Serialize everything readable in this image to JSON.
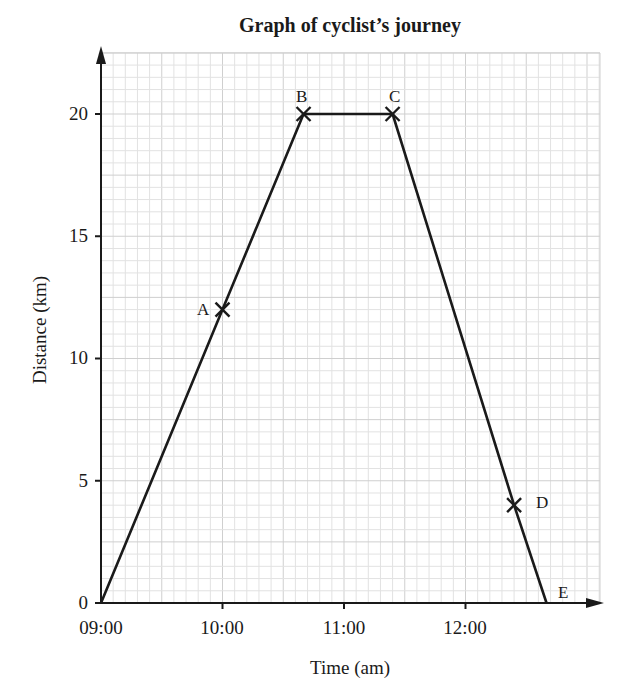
{
  "chart_data": {
    "type": "line",
    "title": "Graph of cyclist’s journey",
    "xlabel": "Time (am)",
    "ylabel": "Distance (km)",
    "x_ticks": [
      "09:00",
      "10:00",
      "11:00",
      "12:00"
    ],
    "y_ticks": [
      "0",
      "5",
      "10",
      "15",
      "20"
    ],
    "xlim_hours": [
      9.0,
      13.25
    ],
    "ylim": [
      0,
      20.5
    ],
    "grid": true,
    "grid_minor": {
      "x_step_minutes": 6,
      "y_step_km": 0.5
    },
    "series": [
      {
        "name": "Cyclist journey",
        "points": [
          {
            "label": "",
            "time": "09:00",
            "hours": 9.0,
            "distance": 0
          },
          {
            "label": "A",
            "time": "10:00",
            "hours": 10.0,
            "distance": 12
          },
          {
            "label": "B",
            "time": "10:40",
            "hours": 10.667,
            "distance": 20
          },
          {
            "label": "C",
            "time": "11:24",
            "hours": 11.4,
            "distance": 20
          },
          {
            "label": "D",
            "time": "12:24",
            "hours": 12.4,
            "distance": 4
          },
          {
            "label": "E",
            "time": "12:40",
            "hours": 12.667,
            "distance": 0
          }
        ]
      }
    ],
    "marked_points": [
      "A",
      "B",
      "C",
      "D"
    ],
    "legend": null
  },
  "labels": {
    "title": "Graph of cyclist’s journey",
    "xlabel": "Time (am)",
    "ylabel": "Distance (km)",
    "x0": "09:00",
    "x1": "10:00",
    "x2": "11:00",
    "x3": "12:00",
    "y0": "0",
    "y5": "5",
    "y10": "10",
    "y15": "15",
    "y20": "20",
    "pA": "A",
    "pB": "B",
    "pC": "C",
    "pD": "D",
    "pE": "E"
  },
  "colors": {
    "grid_minor": "#e2e2e2",
    "grid_major": "#cfcfcf",
    "line": "#1a1a1a"
  }
}
